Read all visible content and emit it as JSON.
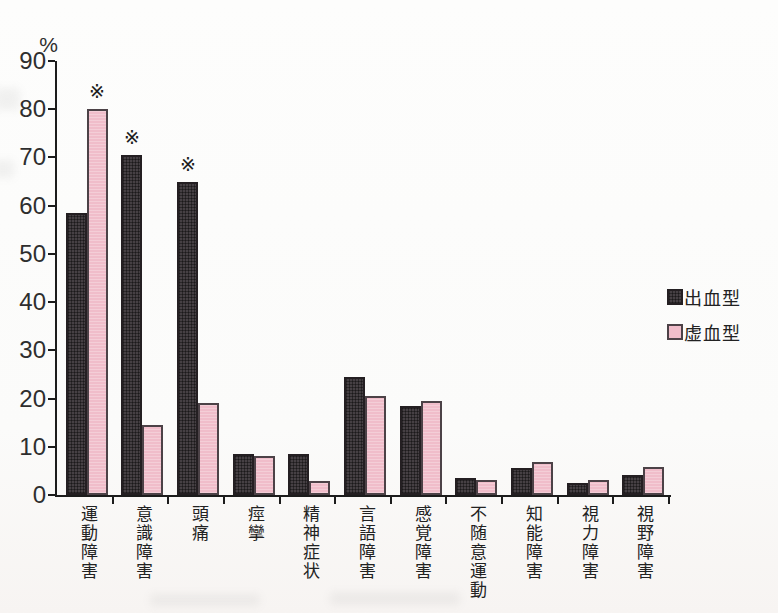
{
  "page": {
    "background": "#fbfbfa",
    "description_unit": "%"
  },
  "chart_data": {
    "type": "bar",
    "title": "",
    "unit_label": "%",
    "categories": [
      "運動障害",
      "意識障害",
      "頭痛",
      "痙攣",
      "精神症状",
      "言語障害",
      "感覚障害",
      "不随意運動",
      "知能障害",
      "視力障害",
      "視野障害"
    ],
    "series": [
      {
        "name": "出血型",
        "key": "hem",
        "color": "#464044",
        "values": [
          58.5,
          70.5,
          65,
          8.5,
          8.5,
          24.5,
          18.5,
          3.5,
          5.5,
          2.4,
          4.2
        ]
      },
      {
        "name": "虚血型",
        "key": "isch",
        "color": "#f0bdca",
        "values": [
          80,
          14.5,
          19,
          8,
          3,
          20.5,
          19.5,
          3.2,
          6.8,
          3.2,
          5.8
        ]
      }
    ],
    "ylim": [
      0,
      90
    ],
    "yticks": [
      0,
      10,
      20,
      30,
      40,
      50,
      60,
      70,
      80,
      90
    ],
    "grid": false,
    "legend_position": "right",
    "annotations": [
      {
        "category_index": 0,
        "series": "虚血型",
        "symbol": "※"
      },
      {
        "category_index": 1,
        "series": "出血型",
        "symbol": "※"
      },
      {
        "category_index": 2,
        "series": "出血型",
        "symbol": "※"
      }
    ]
  },
  "legend": {
    "items": [
      {
        "label": "出血型",
        "swatch": "hem"
      },
      {
        "label": "虚血型",
        "swatch": "isch"
      }
    ]
  }
}
